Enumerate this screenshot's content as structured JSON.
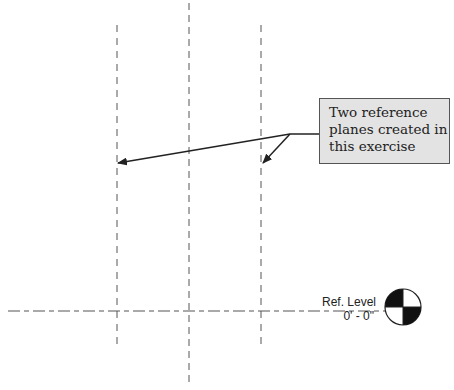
{
  "callout": {
    "lines": [
      "Two reference",
      "planes created in",
      "this exercise"
    ]
  },
  "level": {
    "name": "Ref. Level",
    "elevation": "0' - 0\""
  },
  "reference_planes": [
    {
      "x": 117,
      "y1": 25,
      "y2": 348
    },
    {
      "x": 261,
      "y1": 25,
      "y2": 348
    }
  ],
  "center_line": {
    "x": 189,
    "y1": 3,
    "y2": 386
  },
  "colors": {
    "line": "#444444",
    "callout_fill": "#e3e3e3",
    "arrow": "#222222"
  }
}
